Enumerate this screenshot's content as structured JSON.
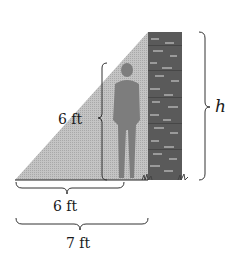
{
  "diagram": {
    "labels": {
      "person_height": "6 ft",
      "person_shadow": "6 ft",
      "total_shadow": "7 ft",
      "wall_height": "h"
    },
    "colors": {
      "shadow": "#b9b9b9",
      "wall": "#5a5a5a",
      "brick_highlight": "#9a9a9a",
      "person": "#7d7d7d",
      "brace": "#333333",
      "ground": "#222222"
    }
  }
}
